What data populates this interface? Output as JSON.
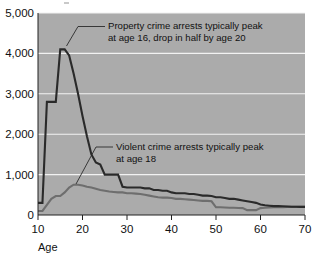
{
  "chart_data": {
    "type": "line",
    "title": "",
    "subtitle": "",
    "xlabel": "Age",
    "ylabel": "",
    "xlim": [
      10,
      70
    ],
    "ylim": [
      0,
      5000
    ],
    "grid": true,
    "legend_position": "none",
    "plot_background": "#ababab",
    "gridline_color": "#f2f2f2",
    "x_ticks": [
      "10",
      "20",
      "30",
      "40",
      "50",
      "60",
      "70"
    ],
    "x_tick_values": [
      10,
      20,
      30,
      40,
      50,
      60,
      70
    ],
    "y_ticks": [
      "0",
      "1,000",
      "2,000",
      "3,000",
      "4,000",
      "5,000"
    ],
    "y_tick_values": [
      0,
      1000,
      2000,
      3000,
      4000,
      5000
    ],
    "x": [
      10,
      11,
      12,
      13,
      14,
      15,
      16,
      17,
      18,
      19,
      20,
      21,
      22,
      23,
      24,
      25,
      26,
      27,
      28,
      29,
      30,
      31,
      32,
      33,
      34,
      35,
      36,
      37,
      38,
      39,
      40,
      41,
      42,
      43,
      44,
      45,
      46,
      47,
      48,
      49,
      50,
      51,
      52,
      53,
      54,
      55,
      56,
      57,
      58,
      59,
      60,
      61,
      62,
      63,
      64,
      65,
      66,
      67,
      68,
      69,
      70
    ],
    "series": [
      {
        "name": "Property crime arrests",
        "color": "#2a2a2a",
        "values": [
          300,
          300,
          2800,
          2800,
          2800,
          4100,
          4100,
          3950,
          3500,
          3000,
          2450,
          1950,
          1500,
          1300,
          1250,
          1000,
          1000,
          1000,
          1000,
          700,
          680,
          680,
          680,
          680,
          660,
          660,
          620,
          620,
          600,
          600,
          560,
          540,
          540,
          540,
          520,
          520,
          500,
          480,
          480,
          470,
          440,
          440,
          420,
          400,
          400,
          380,
          360,
          340,
          320,
          300,
          260,
          240,
          230,
          220,
          220,
          215,
          210,
          205,
          205,
          200,
          200
        ]
      },
      {
        "name": "Violent crime arrests",
        "color": "#6e6e6e",
        "values": [
          100,
          100,
          250,
          400,
          470,
          470,
          560,
          680,
          750,
          750,
          730,
          700,
          680,
          650,
          620,
          600,
          580,
          570,
          560,
          560,
          540,
          540,
          530,
          520,
          500,
          480,
          460,
          440,
          430,
          430,
          420,
          400,
          400,
          390,
          380,
          370,
          360,
          350,
          350,
          340,
          190,
          190,
          185,
          180,
          180,
          175,
          170,
          120,
          120,
          120,
          170,
          180,
          185,
          190,
          195,
          195,
          200,
          200,
          200,
          200,
          200
        ]
      }
    ],
    "annotations": [
      {
        "id": "property-annotation",
        "line1": "Property crime arrests typically peak",
        "line2": "at age 16, drop in half by age 20",
        "points_to_age": 16,
        "points_to_value": 4100
      },
      {
        "id": "violent-annotation",
        "line1": "Violent crime arrests typically peak",
        "line2": "at age 18",
        "points_to_age": 18,
        "points_to_value": 750
      }
    ]
  }
}
